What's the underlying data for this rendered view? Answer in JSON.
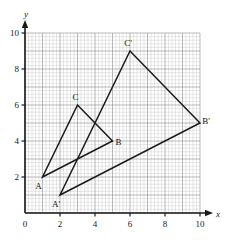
{
  "figure": {
    "title": "",
    "axis": {
      "x_label": "x",
      "y_label": "y",
      "origin_label": "0",
      "x_ticks": [
        "2",
        "4",
        "6",
        "8",
        "10"
      ],
      "y_ticks": [
        "2",
        "4",
        "6",
        "8",
        "10"
      ]
    },
    "grid": {
      "major_color": "#808080",
      "minor_color": "#b9b9b9",
      "axis_color": "#1a1a1a",
      "shape_color": "#1a1a1a"
    },
    "labels": {
      "A": "A",
      "B": "B",
      "C": "C",
      "Ap": "A'",
      "Bp": "B'",
      "Cp": "C'"
    }
  },
  "chart_data": {
    "type": "scatter",
    "title": "",
    "xlabel": "x",
    "ylabel": "y",
    "xlim": [
      0,
      10
    ],
    "ylim": [
      0,
      10
    ],
    "xticks": [
      0,
      2,
      4,
      6,
      8,
      10
    ],
    "yticks": [
      0,
      2,
      4,
      6,
      8,
      10
    ],
    "grid": true,
    "grid_minor_step": 0.2,
    "grid_major_step": 1,
    "legend": "none",
    "series": [
      {
        "name": "Triangle ABC",
        "closed": true,
        "points": [
          {
            "label": "A",
            "x": 1,
            "y": 2
          },
          {
            "label": "B",
            "x": 5,
            "y": 4
          },
          {
            "label": "C",
            "x": 3,
            "y": 6
          }
        ]
      },
      {
        "name": "Triangle A'B'C'",
        "closed": true,
        "points": [
          {
            "label": "A'",
            "x": 2,
            "y": 1
          },
          {
            "label": "B'",
            "x": 10,
            "y": 5
          },
          {
            "label": "C'",
            "x": 6,
            "y": 9
          }
        ]
      }
    ],
    "annotations": [
      {
        "text": "A",
        "x": 1,
        "y": 2,
        "dx": -4,
        "dy": 12
      },
      {
        "text": "B",
        "x": 5,
        "y": 4,
        "dx": 6,
        "dy": 4
      },
      {
        "text": "C",
        "x": 3,
        "y": 6,
        "dx": -2,
        "dy": -5
      },
      {
        "text": "A'",
        "x": 2,
        "y": 1,
        "dx": -4,
        "dy": 12
      },
      {
        "text": "B'",
        "x": 10,
        "y": 5,
        "dx": 6,
        "dy": 1
      },
      {
        "text": "C'",
        "x": 6,
        "y": 9,
        "dx": -2,
        "dy": -5
      }
    ]
  }
}
